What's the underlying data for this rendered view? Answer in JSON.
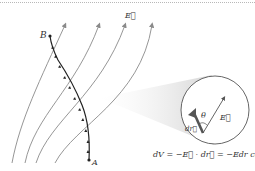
{
  "diagram": {
    "labels": {
      "point_b": "B",
      "point_a": "A",
      "field": "E⃗",
      "theta": "θ",
      "dr": "dr⃗",
      "field_inset": "E⃗"
    },
    "formula": "dV = −E⃗ · dr⃗ = −Edr cosθ",
    "elements": [
      "curved electric field lines with arrowheads pointing up",
      "path from A to B with small arrow markers",
      "magnified circular inset showing dr and E vectors with angle θ"
    ],
    "colors": {
      "field_line": "#8a8a8a",
      "path": "#222222",
      "inset_circle": "#555555",
      "dr_vector": "#555555",
      "cone_shade": "#d8d8d8"
    }
  }
}
